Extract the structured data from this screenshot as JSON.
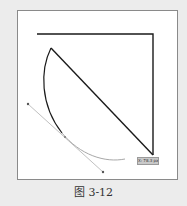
{
  "figure": {
    "caption": "图 3-12",
    "coord_label": "X: 78.3 px",
    "colors": {
      "background": "#ececec",
      "frame_fill": "#ffffff",
      "frame_border": "#8a8a8a",
      "stroke": "#1a1a1a",
      "handle_line": "#b0b0b0",
      "preview_curve": "#a8a8a8"
    }
  }
}
